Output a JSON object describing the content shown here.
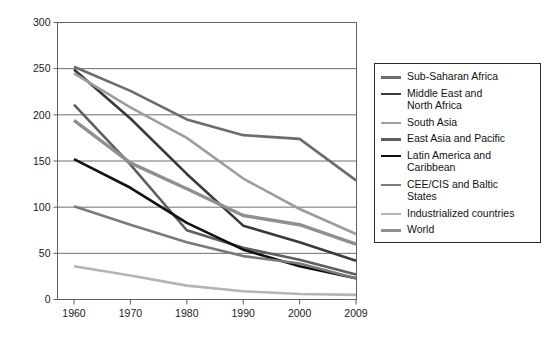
{
  "chart_data": {
    "type": "line",
    "title": "",
    "xlabel": "",
    "ylabel": "",
    "x": [
      "1960",
      "1970",
      "1980",
      "1990",
      "2000",
      "2009"
    ],
    "xticklabels": [
      "1960",
      "1970",
      "1980",
      "1990",
      "2000",
      "2009"
    ],
    "yticklabels": [
      "0",
      "50",
      "100",
      "150",
      "200",
      "250",
      "300"
    ],
    "yticks": [
      0,
      50,
      100,
      150,
      200,
      250,
      300
    ],
    "ylim": [
      0,
      300
    ],
    "grid": "horizontal",
    "legend_position": "right-outside",
    "series": [
      {
        "name": "Sub-Saharan Africa",
        "color": "#6b6b6b",
        "width": 2.6,
        "values": [
          252,
          226,
          195,
          178,
          174,
          129
        ]
      },
      {
        "name": "Middle East and\nNorth Africa",
        "color": "#3a3a3a",
        "width": 2.6,
        "values": [
          249,
          196,
          136,
          80,
          62,
          42
        ]
      },
      {
        "name": "South Asia",
        "color": "#9d9d9d",
        "width": 2.6,
        "values": [
          245,
          208,
          175,
          131,
          98,
          71
        ]
      },
      {
        "name": "East Asia and Pacific",
        "color": "#5e5e5e",
        "width": 2.6,
        "values": [
          211,
          146,
          75,
          56,
          43,
          27
        ]
      },
      {
        "name": "Latin America and\nCaribbean",
        "color": "#111111",
        "width": 2.6,
        "values": [
          152,
          121,
          83,
          54,
          36,
          23
        ]
      },
      {
        "name": "CEE/CIS and Baltic\nStates",
        "color": "#7a7a7a",
        "width": 2.6,
        "values": [
          101,
          81,
          62,
          47,
          39,
          23
        ]
      },
      {
        "name": "Industrialized countries",
        "color": "#b4b4b4",
        "width": 2.6,
        "values": [
          36,
          26,
          15,
          9,
          6,
          5
        ]
      },
      {
        "name": "World",
        "color": "#8f8f8f",
        "width": 3.4,
        "values": [
          194,
          148,
          120,
          91,
          81,
          60
        ]
      }
    ]
  },
  "axes": {
    "frame_color": "#5f5f5f",
    "grid_color": "#6e6e6e"
  }
}
